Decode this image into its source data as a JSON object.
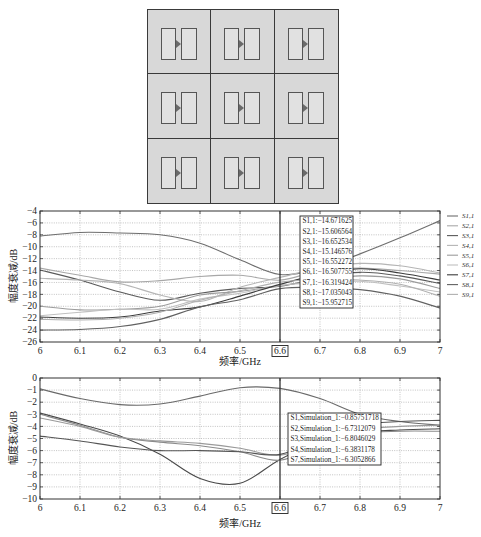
{
  "diagram": {
    "rows": 3,
    "cols": 3,
    "cell_icon": "dual-patch-element-icon",
    "background": "#d8d8d8"
  },
  "chart_data": [
    {
      "type": "line",
      "title": "",
      "xlabel": "频率/GHz",
      "ylabel": "幅度衰减/dB",
      "xlim": [
        6,
        7
      ],
      "ylim": [
        -26,
        -4
      ],
      "grid": true,
      "legend_position": "outside-right",
      "x": [
        6.0,
        6.1,
        6.2,
        6.3,
        6.4,
        6.5,
        6.6,
        6.7,
        6.8,
        6.9,
        7.0
      ],
      "xticks": [
        "6",
        "6.1",
        "6.2",
        "6.3",
        "6.4",
        "6.5",
        "6.6",
        "6.7",
        "6.8",
        "6.9",
        "7"
      ],
      "yticks": [
        -4,
        -6,
        -8,
        -10,
        -12,
        -14,
        -16,
        -18,
        -20,
        -22,
        -24,
        -26
      ],
      "ytick_labels": [
        "−4",
        "−6",
        "−8",
        "−10",
        "−12",
        "−14",
        "−16",
        "−18",
        "−20",
        "−22",
        "−24",
        "−26"
      ],
      "marker_x": 6.6,
      "marker_label": "6.6",
      "series": [
        {
          "name": "S1,1",
          "color": "#6e6e6e",
          "values": [
            -8.2,
            -7.6,
            -7.7,
            -8.0,
            -9.4,
            -12.2,
            -14.67,
            -13.6,
            -11.2,
            -8.5,
            -5.6
          ]
        },
        {
          "name": "S2,1",
          "color": "#a8a8a8",
          "values": [
            -13.6,
            -14.8,
            -15.9,
            -15.7,
            -15.0,
            -14.8,
            -15.61,
            -14.0,
            -13.6,
            -14.0,
            -14.6
          ]
        },
        {
          "name": "S3,1",
          "color": "#5a5a5a",
          "values": [
            -13.9,
            -15.6,
            -17.6,
            -19.0,
            -17.8,
            -17.0,
            -16.65,
            -15.2,
            -14.3,
            -14.9,
            -16.2
          ]
        },
        {
          "name": "S4,1",
          "color": "#b5b5b5",
          "values": [
            -15.3,
            -15.6,
            -16.2,
            -18.1,
            -19.2,
            -16.8,
            -15.15,
            -13.6,
            -12.8,
            -13.2,
            -14.4
          ]
        },
        {
          "name": "S5,1",
          "color": "#9c9c9c",
          "values": [
            -20.0,
            -20.6,
            -20.5,
            -20.0,
            -18.1,
            -17.5,
            -16.55,
            -15.6,
            -14.9,
            -15.4,
            -17.0
          ]
        },
        {
          "name": "S6,1",
          "color": "#c0c0c0",
          "values": [
            -21.6,
            -21.0,
            -20.5,
            -20.5,
            -18.8,
            -17.8,
            -16.51,
            -16.0,
            -15.8,
            -16.6,
            -17.6
          ]
        },
        {
          "name": "S7,1",
          "color": "#3c3c3c",
          "values": [
            -21.8,
            -22.0,
            -21.8,
            -20.8,
            -20.1,
            -18.3,
            -16.32,
            -14.6,
            -13.7,
            -14.4,
            -15.6
          ]
        },
        {
          "name": "S8,1",
          "color": "#616161",
          "values": [
            -24.0,
            -23.9,
            -23.4,
            -22.2,
            -20.1,
            -18.9,
            -17.04,
            -16.8,
            -17.2,
            -18.3,
            -20.3
          ]
        },
        {
          "name": "S9,1",
          "color": "#b0b0b0",
          "values": [
            -22.2,
            -22.3,
            -22.0,
            -21.0,
            -19.0,
            -17.4,
            -15.95,
            -15.5,
            -15.6,
            -16.3,
            -18.3
          ]
        }
      ],
      "legend": [
        "S1,1",
        "S2,1",
        "S3,1",
        "S4,1",
        "S5,1",
        "S6,1",
        "S7,1",
        "S8,1",
        "S9,1"
      ],
      "datatip": {
        "x": 6.6,
        "lines": [
          "S1,1:−14.671625",
          "S2,1:−15.606564",
          "S3,1:−16.652534",
          "S4,1:−15.146576",
          "S5,1:−16.552272",
          "S6,1:−16.507755",
          "S7,1:−16.319424",
          "S8,1:−17.035043",
          "S9,1:−15.952715"
        ]
      }
    },
    {
      "type": "line",
      "title": "",
      "xlabel": "频率/GHz",
      "ylabel": "幅度衰减/dB",
      "xlim": [
        6,
        7
      ],
      "ylim": [
        -10,
        0
      ],
      "grid": true,
      "legend_position": "none",
      "x": [
        6.0,
        6.1,
        6.2,
        6.3,
        6.4,
        6.5,
        6.6,
        6.7,
        6.8,
        6.9,
        7.0
      ],
      "xticks": [
        "6",
        "6.1",
        "6.2",
        "6.3",
        "6.4",
        "6.5",
        "6.6",
        "6.7",
        "6.8",
        "6.9",
        "7"
      ],
      "yticks": [
        0,
        -1,
        -2,
        -3,
        -4,
        -5,
        -6,
        -7,
        -8,
        -9,
        -10
      ],
      "ytick_labels": [
        "0",
        "−1",
        "−2",
        "−3",
        "−4",
        "−5",
        "−6",
        "−7",
        "−8",
        "−9",
        "−10"
      ],
      "marker_x": 6.6,
      "marker_label": "6.6",
      "series": [
        {
          "name": "S1,Simulation_1",
          "color": "#6a6a6a",
          "values": [
            -0.9,
            -1.7,
            -2.2,
            -2.15,
            -1.5,
            -0.8,
            -0.86,
            -1.7,
            -3.0,
            -3.6,
            -3.9
          ]
        },
        {
          "name": "S2,Simulation_1",
          "color": "#4a4a4a",
          "values": [
            -2.9,
            -3.8,
            -4.8,
            -6.3,
            -8.3,
            -8.7,
            -6.73,
            -5.2,
            -4.5,
            -4.3,
            -4.2
          ]
        },
        {
          "name": "S3,Simulation_1",
          "color": "#8a8a8a",
          "values": [
            -3.0,
            -3.9,
            -4.9,
            -5.3,
            -5.6,
            -6.1,
            -6.8,
            -5.6,
            -4.6,
            -4.4,
            -4.4
          ]
        },
        {
          "name": "S4,Simulation_1",
          "color": "#9a9a9a",
          "values": [
            -3.3,
            -4.0,
            -4.9,
            -5.2,
            -5.4,
            -5.8,
            -6.38,
            -5.3,
            -4.3,
            -4.0,
            -3.9
          ]
        },
        {
          "name": "S7,Simulation_1",
          "color": "#555555",
          "values": [
            -4.8,
            -5.2,
            -5.7,
            -6.0,
            -6.0,
            -6.1,
            -6.31,
            -5.0,
            -3.9,
            -3.6,
            -3.5
          ]
        }
      ],
      "legend": [],
      "datatip": {
        "x": 6.6,
        "lines": [
          "S1,Simulation_1:−0.85751718",
          "S2,Simulation_1:−6.7312079",
          "S3,Simulation_1:−6.8046029",
          "S4,Simulation_1:−6.3831178",
          "S7,Simulation_1:−6.3052866"
        ]
      }
    }
  ]
}
